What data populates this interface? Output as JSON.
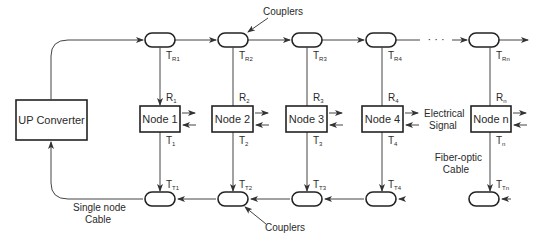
{
  "diagram": {
    "up_converter": "UP Converter",
    "nodes": [
      {
        "label": "Node 1",
        "r": "R",
        "r_sub": "1",
        "t": "T",
        "t_sub": "1",
        "tr": "T",
        "tr_sub": "R1",
        "tt": "T",
        "tt_sub": "T1"
      },
      {
        "label": "Node 2",
        "r": "R",
        "r_sub": "2",
        "t": "T",
        "t_sub": "2",
        "tr": "T",
        "tr_sub": "R2",
        "tt": "T",
        "tt_sub": "T2"
      },
      {
        "label": "Node 3",
        "r": "R",
        "r_sub": "3",
        "t": "T",
        "t_sub": "3",
        "tr": "T",
        "tr_sub": "R3",
        "tt": "T",
        "tt_sub": "T3"
      },
      {
        "label": "Node 4",
        "r": "R",
        "r_sub": "4",
        "t": "T",
        "t_sub": "4",
        "tr": "T",
        "tr_sub": "R4",
        "tt": "T",
        "tt_sub": "T4"
      },
      {
        "label": "Node n",
        "r": "R",
        "r_sub": "n",
        "t": "T",
        "t_sub": "n",
        "tr": "T",
        "tr_sub": "Rn",
        "tt": "T",
        "tt_sub": "Tn"
      }
    ],
    "labels": {
      "couplers_top": "Couplers",
      "couplers_bottom": "Couplers",
      "electrical_1": "Electrical",
      "electrical_2": "Signal",
      "fiber_1": "Fiber-optic",
      "fiber_2": "Cable",
      "single_1": "Single node",
      "single_2": "Cable",
      "ellipsis": "· · ·"
    }
  }
}
